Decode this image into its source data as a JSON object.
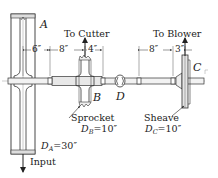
{
  "figure": {
    "components": {
      "pulley_a": {
        "label": "A",
        "diameter_label": "D",
        "diameter_sub": "A",
        "diameter_value": "=30″"
      },
      "sprocket_b": {
        "label": "B",
        "name": "Sprocket",
        "diameter_label": "D",
        "diameter_sub": "B",
        "diameter_value": "=10″"
      },
      "coupling_d": {
        "label": "D"
      },
      "sheave_c": {
        "label": "C",
        "name": "Sheave",
        "diameter_label": "D",
        "diameter_sub": "C",
        "diameter_value": "=10″"
      }
    },
    "arrows": {
      "to_cutter": "To Cutter",
      "to_blower": "To Blower",
      "input": "Input"
    },
    "dimensions": [
      "6″",
      "8″",
      "4″",
      "8″",
      "3″"
    ],
    "colors": {
      "line": "#333333",
      "fill": "#d9d9d9",
      "center_line": "#888888"
    }
  }
}
